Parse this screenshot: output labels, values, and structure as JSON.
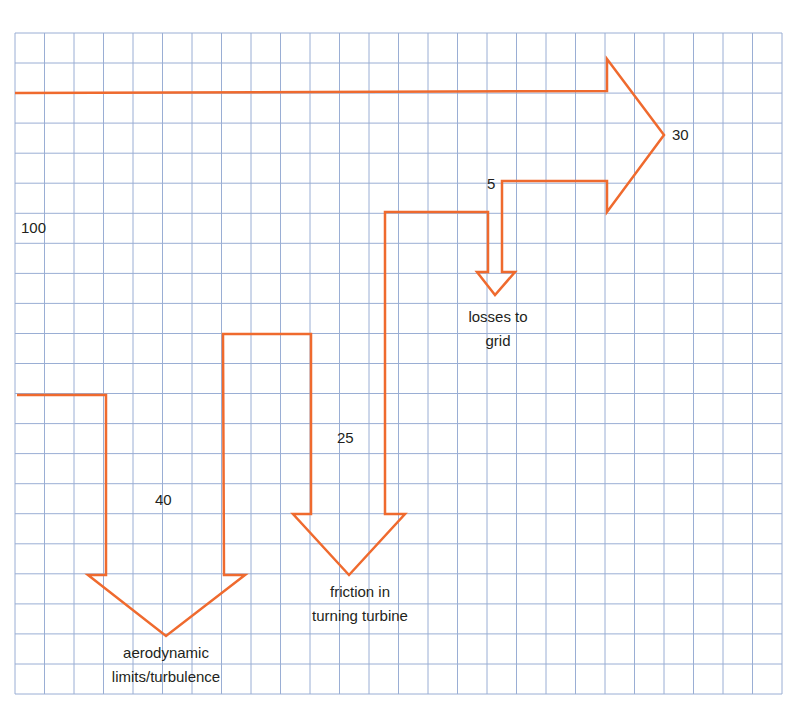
{
  "diagram": {
    "type": "sankey-energy-flow",
    "grid": {
      "left": 15,
      "top": 33,
      "right": 782,
      "bottom": 694,
      "cols": 26,
      "rows": 22,
      "line_color": "#9aaed4"
    },
    "arrow_color": "#ef6a2e",
    "labels": {
      "input_value": "100",
      "output_value": "30",
      "aero_value": "40",
      "aero_text_line1": "aerodynamic",
      "aero_text_line2": "limits/turbulence",
      "friction_value": "25",
      "friction_text_line1": "friction in",
      "friction_text_line2": "turning turbine",
      "grid_value": "5",
      "grid_text_line1": "losses to",
      "grid_text_line2": "grid"
    },
    "flows": [
      {
        "name": "input",
        "value": 100
      },
      {
        "name": "aerodynamic limits/turbulence",
        "value": 40
      },
      {
        "name": "friction in turning turbine",
        "value": 25
      },
      {
        "name": "losses to grid",
        "value": 5
      },
      {
        "name": "output",
        "value": 30
      }
    ]
  }
}
